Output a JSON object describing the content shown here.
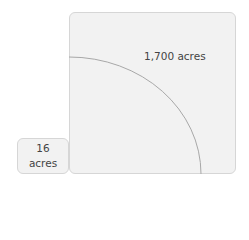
{
  "diagram": {
    "large_area": {
      "label": "1,700 acres"
    },
    "small_area": {
      "line1": "16",
      "line2": "acres"
    },
    "colors": {
      "fill": "#f2f2f2",
      "border": "#d6d6d6",
      "arc": "#a8a8a8",
      "text": "#444444"
    }
  }
}
